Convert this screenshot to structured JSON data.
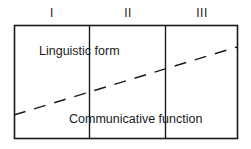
{
  "diagram": {
    "columns": [
      {
        "label": "I"
      },
      {
        "label": "II"
      },
      {
        "label": "III"
      }
    ],
    "regions": {
      "upper_label": "Linguistic form",
      "lower_label": "Communicative function"
    },
    "line": {
      "style": "dashed",
      "direction": "ascending left to right"
    },
    "colors": {
      "stroke": "#1a1a1a",
      "background": "#ffffff"
    }
  }
}
